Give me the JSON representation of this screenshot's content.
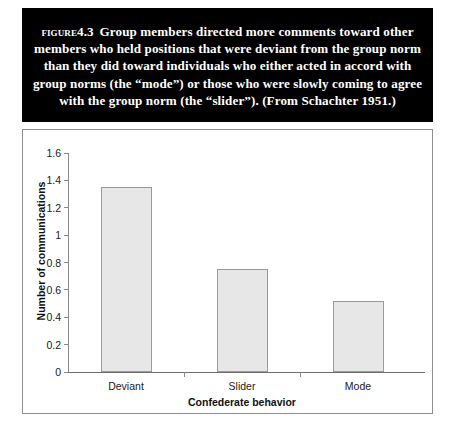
{
  "caption": {
    "figure_label": "Figure",
    "figure_number": "4.3",
    "text": "Group members directed more comments toward other members who held positions that were deviant from the group norm than they did toward individuals who either acted in accord with group norms (the “mode”) or those who were slowly coming to agree with the group norm (the “slider”). (From Schachter 1951.)"
  },
  "colors": {
    "caption_background": "#000000",
    "caption_text": "#ffffff",
    "bar_fill": "#e7e7e7",
    "bar_border": "#9a9a9a",
    "axis": "#8a8a8a",
    "frame": "#8e8e8e"
  },
  "chart_data": {
    "type": "bar",
    "title": "",
    "categories": [
      "Deviant",
      "Slider",
      "Mode"
    ],
    "values": [
      1.35,
      0.75,
      0.52
    ],
    "xlabel": "Confederate behavior",
    "ylabel": "Number of communications",
    "ylim": [
      0,
      1.6
    ],
    "ytick_labels": [
      "0",
      "0.2",
      "0.4",
      "0.6",
      "0.8",
      "1",
      "1.2",
      "1.4",
      "1.6"
    ],
    "ytick_values": [
      0,
      0.2,
      0.4,
      0.6,
      0.8,
      1,
      1.2,
      1.4,
      1.6
    ],
    "grid": false,
    "legend": false
  }
}
